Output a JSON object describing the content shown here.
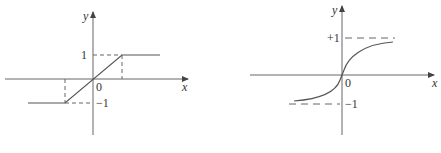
{
  "figures": [
    {
      "name": "saturating-linear",
      "axis_labels": {
        "x": "x",
        "y": "y"
      },
      "origin_label": "0",
      "tick_labels": {
        "upper": "1",
        "lower": "−1"
      }
    },
    {
      "name": "sigmoid-like",
      "axis_labels": {
        "x": "x",
        "y": "y"
      },
      "origin_label": "0",
      "tick_labels": {
        "upper": "+1",
        "lower": "−1"
      }
    }
  ],
  "colors": {
    "line": "#555555",
    "axis": "#555555",
    "dash": "#666666"
  }
}
